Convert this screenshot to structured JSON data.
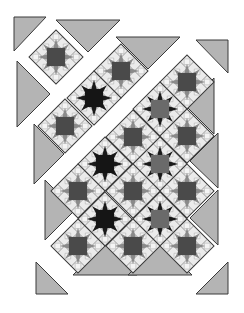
{
  "diagram": {
    "colors": {
      "background": "#ffffff",
      "setting_triangle": "#b4b4b4",
      "outline": "#3a3a3a",
      "block_bg": "#ebebeb",
      "block_grid": "#555555",
      "light_square": "#f4f4f4",
      "star_center_dark": "#4a4a4a",
      "star_center_black": "#151515",
      "star_point_medium": "#8a8a8a",
      "star_point_black": "#1a1a1a",
      "star_center_mid": "#6a6a6a"
    },
    "block_half_diagonal": 27,
    "blocks": [
      {
        "cx": 56,
        "cy": 57,
        "style": "dark"
      },
      {
        "cx": 121,
        "cy": 71,
        "style": "dark"
      },
      {
        "cx": 94,
        "cy": 98,
        "style": "black"
      },
      {
        "cx": 65,
        "cy": 126,
        "style": "dark"
      },
      {
        "cx": 187,
        "cy": 82,
        "style": "dark"
      },
      {
        "cx": 160,
        "cy": 109,
        "style": "blackpoints"
      },
      {
        "cx": 187,
        "cy": 136,
        "style": "dark"
      },
      {
        "cx": 133,
        "cy": 137,
        "style": "dark"
      },
      {
        "cx": 105,
        "cy": 164,
        "style": "black"
      },
      {
        "cx": 160,
        "cy": 164,
        "style": "blackpoints"
      },
      {
        "cx": 78,
        "cy": 191,
        "style": "dark"
      },
      {
        "cx": 133,
        "cy": 191,
        "style": "dark"
      },
      {
        "cx": 187,
        "cy": 191,
        "style": "dark"
      },
      {
        "cx": 105,
        "cy": 219,
        "style": "black"
      },
      {
        "cx": 160,
        "cy": 219,
        "style": "blackpoints"
      },
      {
        "cx": 78,
        "cy": 246,
        "style": "dark"
      },
      {
        "cx": 133,
        "cy": 246,
        "style": "dark"
      },
      {
        "cx": 187,
        "cy": 246,
        "style": "dark"
      }
    ],
    "setting_triangles": [
      {
        "points": "14,17 46,17 14,51"
      },
      {
        "points": "56,20 120,20 88,52"
      },
      {
        "points": "116,37 180,37 148,69"
      },
      {
        "points": "196,40 228,40 228,73"
      },
      {
        "points": "17,61 50,94 17,127"
      },
      {
        "points": "34,124 64,154 34,184"
      },
      {
        "points": "214,78 214,134 186,106"
      },
      {
        "points": "45,180 75,210 45,240"
      },
      {
        "points": "218,133 218,188 190,161"
      },
      {
        "points": "218,190 218,245 190,218"
      },
      {
        "points": "73,275 105,243 137,275"
      },
      {
        "points": "128,275 160,243 192,275"
      },
      {
        "points": "36,262 68,294 36,294"
      },
      {
        "points": "228,262 228,294 196,294"
      }
    ]
  }
}
